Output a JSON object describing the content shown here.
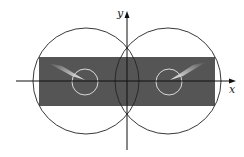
{
  "diagram": {
    "axes": {
      "x_label": "x",
      "y_label": "y"
    },
    "colors": {
      "background": "#ffffff",
      "rectangle_fill": "#555555",
      "outline": "#222222",
      "small_circle_stroke": "#d8d8d8",
      "streak": "#e6e6e6"
    },
    "shapes": {
      "rectangle": {
        "x": 39,
        "y": 57,
        "width": 176,
        "height": 49
      },
      "left_circle": {
        "cx": 86,
        "cy": 81,
        "r": 53
      },
      "right_circle": {
        "cx": 168,
        "cy": 81,
        "r": 53
      },
      "left_small_circle": {
        "cx": 85,
        "cy": 82,
        "r": 13
      },
      "right_small_circle": {
        "cx": 169,
        "cy": 82,
        "r": 13
      }
    }
  }
}
